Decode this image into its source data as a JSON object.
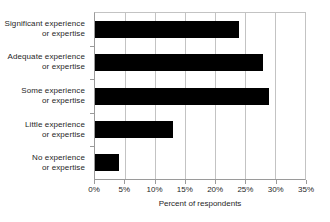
{
  "chart_data": {
    "type": "bar",
    "orientation": "horizontal",
    "title": "",
    "xlabel": "Percent of respondents",
    "ylabel": "",
    "categories": [
      "Significant experience or expertise",
      "Adequate experience or expertise",
      "Some experience or expertise",
      "Little experience or expertise",
      "No experience or expertise"
    ],
    "category_lines": [
      [
        "Significant experience",
        "or expertise"
      ],
      [
        "Adequate experience",
        "or expertise"
      ],
      [
        "Some experience",
        "or expertise"
      ],
      [
        "Little experience",
        "or expertise"
      ],
      [
        "No experience",
        "or expertise"
      ]
    ],
    "values": [
      24,
      28,
      29,
      13,
      4
    ],
    "xlim": [
      0,
      35
    ],
    "xticks": [
      0,
      5,
      10,
      15,
      20,
      25,
      30,
      35
    ],
    "xtick_labels": [
      "0%",
      "5%",
      "10%",
      "15%",
      "20%",
      "25%",
      "30%",
      "35%"
    ],
    "grid": "vertical",
    "legend": "none",
    "bar_color": "#000000",
    "grid_color": "#c3c3c3",
    "axis_color": "#9a9a9a",
    "background_color": "#ffffff"
  }
}
